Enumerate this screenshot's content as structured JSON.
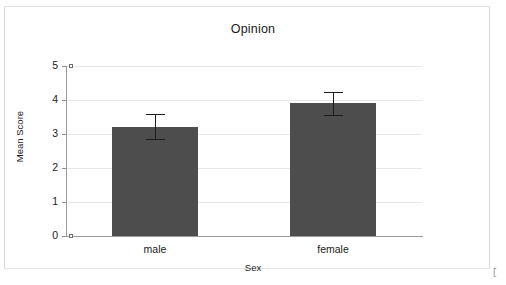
{
  "chart_data": {
    "type": "bar",
    "title": "Opinion",
    "xlabel": "Sex",
    "ylabel": "Mean Score",
    "categories": [
      "male",
      "female"
    ],
    "values": [
      3.22,
      3.9
    ],
    "errors": [
      0.37,
      0.35
    ],
    "error_type": "error-bar",
    "ylim": [
      0,
      5
    ],
    "yticks": [
      "0",
      "1",
      "2",
      "3",
      "4",
      "5"
    ],
    "ytick_values": [
      0,
      1,
      2,
      3,
      4,
      5
    ],
    "grid": "horizontal",
    "legend": "none",
    "bar_color": "#4d4d4d",
    "axis_color": "#9a9a9a",
    "grid_color": "#e8e8e8",
    "text_color": "#1a1a1a"
  },
  "figure": {
    "corner_mark": "["
  }
}
